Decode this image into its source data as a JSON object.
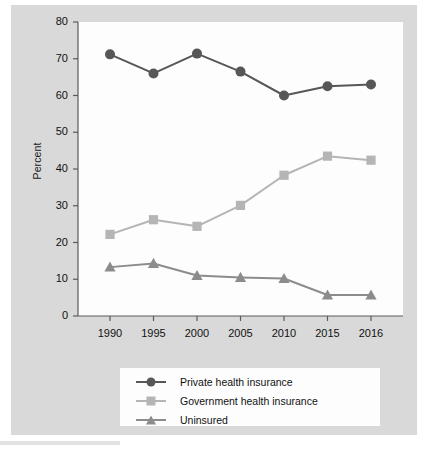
{
  "figure": {
    "background_color": "#d9d9d9",
    "panel_color": "#fdfdfd"
  },
  "chart_data": {
    "type": "line",
    "title": "",
    "subtitle": "",
    "xlabel": "",
    "ylabel": "Percent",
    "categories": [
      "1990",
      "1995",
      "2000",
      "2005",
      "2010",
      "2015",
      "2016"
    ],
    "x_tick_labels": [
      "1990",
      "1995",
      "2000",
      "2005",
      "2010",
      "2015",
      "2016"
    ],
    "y_tick_labels": [
      "0",
      "10",
      "20",
      "30",
      "40",
      "50",
      "60",
      "70",
      "80"
    ],
    "y_ticks": [
      0,
      10,
      20,
      30,
      40,
      50,
      60,
      70,
      80
    ],
    "ylim": [
      0,
      80
    ],
    "grid": false,
    "legend_position": "below-center",
    "series": [
      {
        "name": "Private health insurance",
        "marker": "circle",
        "color": "#575757",
        "values": [
          71.2,
          66.0,
          71.4,
          66.5,
          60.0,
          62.5,
          63.0
        ]
      },
      {
        "name": "Government health insurance",
        "marker": "square",
        "color": "#b5b5b5",
        "values": [
          22.2,
          26.2,
          24.4,
          30.1,
          38.3,
          43.5,
          42.4
        ]
      },
      {
        "name": "Uninsured",
        "marker": "triangle",
        "color": "#8c8c8c",
        "values": [
          13.3,
          14.3,
          11.0,
          10.5,
          10.2,
          5.7,
          5.7
        ]
      }
    ]
  },
  "legend": {
    "items": [
      {
        "label": "Private health insurance",
        "marker": "circle-marker-icon",
        "color": "#575757"
      },
      {
        "label": "Government health insurance",
        "marker": "square-marker-icon",
        "color": "#b5b5b5"
      },
      {
        "label": "Uninsured",
        "marker": "triangle-marker-icon",
        "color": "#8c8c8c"
      }
    ]
  }
}
